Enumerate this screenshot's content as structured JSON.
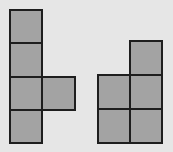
{
  "colors": {
    "background": "#e6e6e6",
    "fill": "#a3a3a3",
    "stroke": "#1e1e1e"
  },
  "shapes": [
    {
      "name": "left-shape",
      "squares": [
        {
          "x": 9,
          "y": 9,
          "w": 34,
          "h": 35
        },
        {
          "x": 9,
          "y": 42,
          "w": 34,
          "h": 36
        },
        {
          "x": 9,
          "y": 76,
          "w": 34,
          "h": 35
        },
        {
          "x": 41,
          "y": 76,
          "w": 35,
          "h": 35
        },
        {
          "x": 9,
          "y": 109,
          "w": 34,
          "h": 35
        }
      ]
    },
    {
      "name": "right-shape",
      "squares": [
        {
          "x": 129,
          "y": 40,
          "w": 34,
          "h": 36
        },
        {
          "x": 97,
          "y": 74,
          "w": 34,
          "h": 36
        },
        {
          "x": 129,
          "y": 74,
          "w": 34,
          "h": 36
        },
        {
          "x": 97,
          "y": 108,
          "w": 34,
          "h": 36
        },
        {
          "x": 129,
          "y": 108,
          "w": 34,
          "h": 36
        }
      ]
    }
  ]
}
